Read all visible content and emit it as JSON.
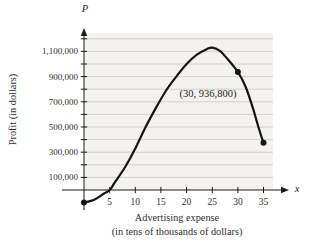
{
  "figure": {
    "p_axis_symbol": "P",
    "x_axis_symbol": "x",
    "y_title": "Profit (in dollars)",
    "x_title_line1": "Advertising expense",
    "x_title_line2": "(in tens of thousands of dollars)",
    "annotation_label": "(30, 936,800)"
  },
  "colors": {
    "plot_bg": "#f3f2ef",
    "gridline": "#c9c8c6",
    "axis": "#1a1a1a",
    "curve": "#141414",
    "dot": "#141414",
    "text": "#2f2f2f"
  },
  "chart_data": {
    "type": "line",
    "title": "",
    "xlabel": "Advertising expense (in tens of thousands of dollars)",
    "ylabel": "Profit (in dollars)",
    "x_axis_symbol": "x",
    "y_axis_symbol": "P",
    "xlim": [
      0,
      38
    ],
    "ylim": [
      -150000,
      1250000
    ],
    "grid": "horizontal",
    "grid_step": 100000,
    "grid_min": 100000,
    "grid_max": 1200000,
    "x_ticks": [
      5,
      10,
      15,
      20,
      25,
      30,
      35
    ],
    "y_tick_minor_values": [
      100000,
      200000,
      300000,
      400000,
      500000,
      600000,
      700000,
      800000,
      900000,
      1000000,
      1100000,
      1200000
    ],
    "y_tick_labels": [
      {
        "text": "100,000",
        "value": 100000
      },
      {
        "text": "300,000",
        "value": 300000
      },
      {
        "text": "500,000",
        "value": 500000
      },
      {
        "text": "700,000",
        "value": 700000
      },
      {
        "text": "900,000",
        "value": 900000
      },
      {
        "text": "1,100,000",
        "value": 1100000
      }
    ],
    "curve_points": [
      [
        0,
        -100000
      ],
      [
        2,
        -78000
      ],
      [
        4,
        -25000
      ],
      [
        5,
        0
      ],
      [
        6,
        60000
      ],
      [
        8,
        180000
      ],
      [
        10,
        330000
      ],
      [
        12,
        500000
      ],
      [
        14,
        650000
      ],
      [
        16,
        790000
      ],
      [
        18,
        900000
      ],
      [
        20,
        1000000
      ],
      [
        22,
        1075000
      ],
      [
        24,
        1120000
      ],
      [
        25,
        1130000
      ],
      [
        26.5,
        1105000
      ],
      [
        28,
        1040000
      ],
      [
        30,
        936800
      ],
      [
        31.5,
        820000
      ],
      [
        33,
        640000
      ],
      [
        34,
        500000
      ],
      [
        35,
        375000
      ]
    ],
    "marked_points": [
      {
        "x": 0,
        "y": -100000,
        "label": "",
        "note": "start point (estimated)"
      },
      {
        "x": 30,
        "y": 936800,
        "label": "(30, 936,800)",
        "note": "labeled point"
      },
      {
        "x": 35,
        "y": 375000,
        "label": "",
        "note": "end point (estimated)"
      }
    ],
    "peak_estimate": {
      "x": 24.5,
      "y": 1130000
    }
  }
}
